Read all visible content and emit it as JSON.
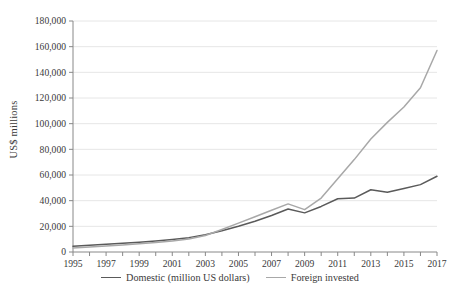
{
  "chart_data": {
    "type": "line",
    "title": "",
    "xlabel": "",
    "ylabel": "US$ millions",
    "x": [
      1995,
      1996,
      1997,
      1998,
      1999,
      2000,
      2001,
      2002,
      2003,
      2004,
      2005,
      2006,
      2007,
      2008,
      2009,
      2010,
      2011,
      2012,
      2013,
      2014,
      2015,
      2016,
      2017
    ],
    "xlim": [
      1995,
      2017
    ],
    "ylim": [
      0,
      180000
    ],
    "ytick_step": 20000,
    "xtick_labels": [
      "1995",
      "1997",
      "1999",
      "2001",
      "2003",
      "2005",
      "2007",
      "2009",
      "2011",
      "2013",
      "2015",
      "2017"
    ],
    "ytick_labels": [
      "0",
      "20,000",
      "40,000",
      "60,000",
      "80,000",
      "100,000",
      "120,000",
      "140,000",
      "160,000",
      "180,000"
    ],
    "grid": "horizontal",
    "legend_position": "bottom",
    "series": [
      {
        "name": "Domestic (million US dollars)",
        "color": "#5a5a5a",
        "values": [
          4500,
          5200,
          6000,
          6800,
          7600,
          8600,
          9800,
          11200,
          13500,
          16500,
          20000,
          24000,
          28500,
          33500,
          30500,
          35500,
          41500,
          42000,
          48500,
          46500,
          49500,
          52500,
          59000
        ]
      },
      {
        "name": "Foreign invested",
        "color": "#a8a8a8",
        "values": [
          3200,
          3900,
          4700,
          5500,
          6400,
          7400,
          8600,
          10200,
          12800,
          17500,
          22500,
          27500,
          32500,
          37500,
          33000,
          42000,
          57000,
          72000,
          88000,
          101000,
          113000,
          128000,
          157000
        ]
      }
    ],
    "axis_color": "#888888",
    "grid_color": "#e6e6e6"
  },
  "plot_geometry": {
    "left": 73,
    "right": 437,
    "top": 21,
    "bottom": 252
  }
}
